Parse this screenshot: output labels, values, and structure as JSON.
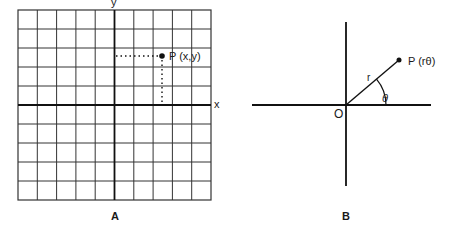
{
  "diagram_a": {
    "caption": "A",
    "x_axis_label": "x",
    "y_axis_label": "y",
    "point_label": "P (x,y)",
    "grid": {
      "columns": 10,
      "rows": 10
    }
  },
  "diagram_b": {
    "caption": "B",
    "origin_label": "O",
    "radius_label": "r",
    "angle_label": "θ",
    "point_label": "P (rθ)"
  },
  "colors": {
    "ink": "#1a1a1a",
    "background": "#ffffff"
  }
}
